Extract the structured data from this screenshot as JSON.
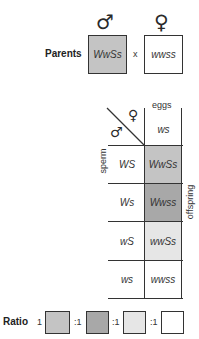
{
  "parents": {
    "label": "Parents",
    "cross_symbol": "x",
    "male": {
      "symbol": "♂",
      "genotype": "WwSs",
      "color": "#c4c4c4"
    },
    "female": {
      "symbol": "♀",
      "genotype": "wwss",
      "color": "#ffffff"
    }
  },
  "punnett": {
    "corner_male_symbol": "♂",
    "corner_female_symbol": "♀",
    "eggs_label": "eggs",
    "sperm_label": "sperm",
    "offspring_label": "offspring",
    "egg_gametes": [
      "ws"
    ],
    "rows": [
      {
        "sperm": "WS",
        "offspring": "WwSs",
        "color": "#c4c4c4"
      },
      {
        "sperm": "Ws",
        "offspring": "Wwss",
        "color": "#a8a8a8"
      },
      {
        "sperm": "wS",
        "offspring": "wwSs",
        "color": "#e6e6e6"
      },
      {
        "sperm": "ws",
        "offspring": "wwss",
        "color": "#ffffff"
      }
    ]
  },
  "ratio": {
    "label": "Ratio",
    "parts": [
      {
        "value": "1",
        "color": "#c4c4c4"
      },
      {
        "value": ":1",
        "color": "#a8a8a8"
      },
      {
        "value": ":1",
        "color": "#e6e6e6"
      },
      {
        "value": ":1",
        "color": "#ffffff"
      }
    ]
  }
}
